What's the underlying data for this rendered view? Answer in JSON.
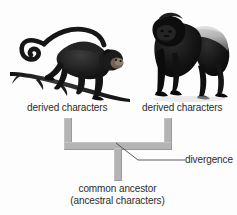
{
  "diagram": {
    "type": "phylogenetic-bracket",
    "title_text_present": false,
    "organisms": [
      {
        "position": "left",
        "icon": "spider-monkey-on-branch-illustration",
        "label": "derived characters"
      },
      {
        "position": "right",
        "icon": "gorilla-illustration",
        "label": "derived characters"
      }
    ],
    "annotations": {
      "divergence_label": "divergence",
      "ancestor_line_1": "common ancestor",
      "ancestor_line_2": "(ancestral characters)"
    },
    "colors": {
      "background": "#fdfdfd",
      "bracket": "#b4b4b4",
      "text": "#2b2b2b",
      "leader_line": "#4a4a4a",
      "monkey_body": "#1a1a1a",
      "branch": "#2a2a2a",
      "gorilla_body": "#141414",
      "gorilla_saddle": "#b9b9b9"
    }
  }
}
